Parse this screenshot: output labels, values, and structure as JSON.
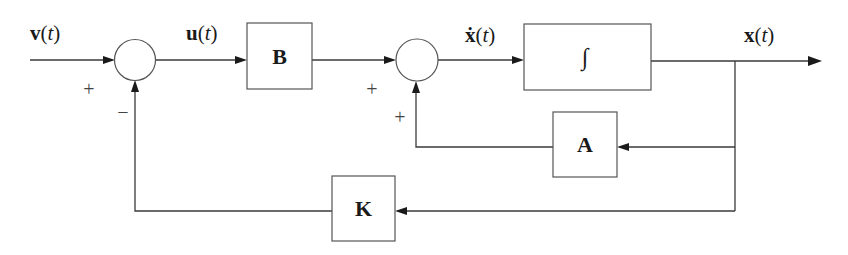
{
  "diagram": {
    "colors": {
      "line": "#3a3a3a",
      "text": "#1a1a1a",
      "background": "#ffffff"
    },
    "signals": {
      "v": {
        "symbol": "v",
        "arg": "t",
        "open": "(",
        "close": ")"
      },
      "u": {
        "symbol": "u",
        "arg": "t",
        "open": "(",
        "close": ")"
      },
      "xdot": {
        "symbol": "ẋ",
        "arg": "t",
        "open": "(",
        "close": ")"
      },
      "x": {
        "symbol": "x",
        "arg": "t",
        "open": "(",
        "close": ")"
      }
    },
    "blocks": {
      "B": {
        "label": "B"
      },
      "integrator": {
        "label": "∫"
      },
      "A": {
        "label": "A"
      },
      "K": {
        "label": "K"
      }
    },
    "summing_junctions": {
      "sum1": {
        "sign_left": "+",
        "sign_bottom": "−"
      },
      "sum2": {
        "sign_left": "+",
        "sign_bottom": "+"
      }
    }
  }
}
